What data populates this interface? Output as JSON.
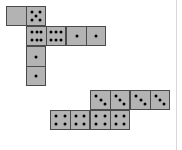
{
  "figure": {
    "background_color": "#ffffff",
    "tile_fill_color": "#b3b3b3",
    "tile_border_color": "#4a4a4a",
    "pip_color": "#000000",
    "edge_rule_color": "#d8d8d8",
    "cell_size": 20,
    "groups": [
      {
        "name": "upper-group",
        "dominoes": [
          {
            "id": "upper-domino-1",
            "orientation": "horizontal",
            "x": 6,
            "y": 6,
            "values": [
              0,
              5
            ],
            "description": "blank and five"
          },
          {
            "id": "upper-domino-2",
            "orientation": "horizontal",
            "x": 26,
            "y": 26,
            "values": [
              6,
              6
            ],
            "description": "six and six"
          },
          {
            "id": "upper-domino-3",
            "orientation": "horizontal",
            "x": 66,
            "y": 26,
            "values": [
              1,
              1
            ],
            "description": "one and one"
          },
          {
            "id": "upper-domino-4",
            "orientation": "vertical",
            "x": 26,
            "y": 46,
            "values": [
              1,
              1
            ],
            "description": "one and one vertical"
          }
        ]
      },
      {
        "name": "lower-group",
        "dominoes": [
          {
            "id": "lower-domino-1",
            "orientation": "horizontal",
            "x": 90,
            "y": 90,
            "values": [
              3,
              3
            ],
            "description": "three and three"
          },
          {
            "id": "lower-domino-2",
            "orientation": "horizontal",
            "x": 130,
            "y": 90,
            "values": [
              3,
              3
            ],
            "description": "three and three"
          },
          {
            "id": "lower-domino-3",
            "orientation": "horizontal",
            "x": 50,
            "y": 110,
            "values": [
              4,
              4
            ],
            "description": "four and four"
          },
          {
            "id": "lower-domino-4",
            "orientation": "horizontal",
            "x": 90,
            "y": 110,
            "values": [
              4,
              4
            ],
            "description": "four and four"
          }
        ]
      }
    ],
    "edge_rule_x": 176
  },
  "pip_layouts": {
    "0": [],
    "1": [
      [
        50,
        50
      ]
    ],
    "2": [
      [
        28,
        28
      ],
      [
        72,
        72
      ]
    ],
    "3": [
      [
        26,
        26
      ],
      [
        50,
        50
      ],
      [
        74,
        74
      ]
    ],
    "4": [
      [
        28,
        28
      ],
      [
        72,
        28
      ],
      [
        28,
        72
      ],
      [
        72,
        72
      ]
    ],
    "5": [
      [
        28,
        26
      ],
      [
        72,
        26
      ],
      [
        50,
        50
      ],
      [
        28,
        74
      ],
      [
        72,
        74
      ]
    ],
    "6": [
      [
        24,
        30
      ],
      [
        50,
        30
      ],
      [
        76,
        30
      ],
      [
        24,
        70
      ],
      [
        50,
        70
      ],
      [
        76,
        70
      ]
    ]
  }
}
